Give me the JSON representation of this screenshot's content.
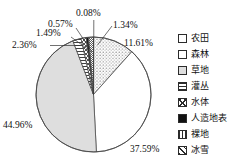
{
  "chart_data": {
    "type": "pie",
    "title": "",
    "subtitle": "",
    "xlabel": "",
    "ylabel": "",
    "grid": false,
    "legend_position": "right",
    "start_angle_deg": 0,
    "direction": "clockwise",
    "units": "percent",
    "categories": [
      "农田",
      "森林",
      "草地",
      "灌丛",
      "水体",
      "人造地表",
      "裸地",
      "冰雪"
    ],
    "values": [
      11.61,
      37.59,
      44.96,
      2.36,
      1.49,
      0.57,
      0.08,
      1.34
    ],
    "labels": [
      "11.61%",
      "37.59%",
      "44.96%",
      "2.36%",
      "1.49%",
      "0.57%",
      "0.08%",
      "1.34%"
    ],
    "patterns": [
      "dotted",
      "blank",
      "light-gray",
      "horizontal-lines",
      "cross-hatch",
      "solid-black",
      "vertical-lines",
      "diagonal-hatch"
    ],
    "slices": [
      {
        "name": "农田",
        "value": 11.61,
        "label": "11.61%",
        "pattern": "dotted"
      },
      {
        "name": "森林",
        "value": 37.59,
        "label": "37.59%",
        "pattern": "blank"
      },
      {
        "name": "草地",
        "value": 44.96,
        "label": "44.96%",
        "pattern": "light-gray"
      },
      {
        "name": "灌丛",
        "value": 2.36,
        "label": "2.36%",
        "pattern": "horizontal-lines"
      },
      {
        "name": "水体",
        "value": 1.49,
        "label": "1.49%",
        "pattern": "cross-hatch"
      },
      {
        "name": "人造地表",
        "value": 0.57,
        "label": "0.57%",
        "pattern": "solid-black"
      },
      {
        "name": "裸地",
        "value": 0.08,
        "label": "0.08%",
        "pattern": "vertical-lines"
      },
      {
        "name": "冰雪",
        "value": 1.34,
        "label": "1.34%",
        "pattern": "diagonal-hatch"
      }
    ]
  },
  "legend": {
    "items": [
      {
        "label": "农田",
        "pattern": "dotted"
      },
      {
        "label": "森林",
        "pattern": "blank"
      },
      {
        "label": "草地",
        "pattern": "light-gray"
      },
      {
        "label": "灌丛",
        "pattern": "horizontal-lines"
      },
      {
        "label": "水体",
        "pattern": "cross-hatch"
      },
      {
        "label": "人造地表",
        "pattern": "solid-black"
      },
      {
        "label": "裸地",
        "pattern": "vertical-lines"
      },
      {
        "label": "冰雪",
        "pattern": "diagonal-hatch"
      }
    ]
  },
  "callouts": {
    "p_0_08": "0.08%",
    "p_0_57": "0.57%",
    "p_1_49": "1.49%",
    "p_2_36": "2.36%",
    "p_1_34": "1.34%",
    "p_11_61": "11.61%",
    "p_37_59": "37.59%",
    "p_44_96": "44.96%"
  },
  "colors": {
    "outline": "#4a4a4a",
    "grassland_gray": "#dedede",
    "artificial_black": "#111111",
    "text": "#111111"
  }
}
